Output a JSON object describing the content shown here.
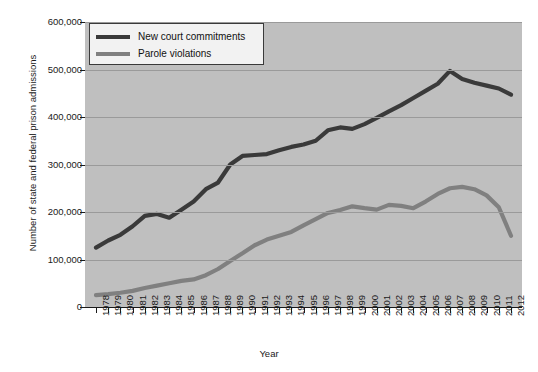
{
  "chart_data": {
    "type": "line",
    "title": "",
    "xlabel": "Year",
    "ylabel": "Number of state and federal prison admissions",
    "xlim": [
      1978,
      2012
    ],
    "ylim": [
      0,
      600000
    ],
    "grid": true,
    "legend_position": "top-left",
    "x": [
      1978,
      1979,
      1980,
      1981,
      1982,
      1983,
      1984,
      1985,
      1986,
      1987,
      1988,
      1989,
      1990,
      1991,
      1992,
      1993,
      1994,
      1995,
      1996,
      1997,
      1998,
      1999,
      2000,
      2001,
      2002,
      2003,
      2004,
      2005,
      2006,
      2007,
      2008,
      2009,
      2010,
      2011,
      2012
    ],
    "ytick_labels": [
      "0",
      "100,000",
      "200,000",
      "300,000",
      "400,000",
      "500,000",
      "600,000"
    ],
    "ytick_values": [
      0,
      100000,
      200000,
      300000,
      400000,
      500000,
      600000
    ],
    "series": [
      {
        "name": "New court commitments",
        "color": "#3a3a3a",
        "values": [
          125000,
          140000,
          152000,
          170000,
          192000,
          196000,
          188000,
          205000,
          222000,
          248000,
          262000,
          300000,
          318000,
          320000,
          322000,
          330000,
          337000,
          342000,
          350000,
          372000,
          378000,
          375000,
          385000,
          398000,
          412000,
          425000,
          440000,
          455000,
          470000,
          497000,
          480000,
          472000,
          466000,
          460000,
          447000
        ]
      },
      {
        "name": "Parole violations",
        "color": "#808080",
        "values": [
          25000,
          27000,
          30000,
          34000,
          40000,
          45000,
          50000,
          55000,
          58000,
          67000,
          80000,
          97000,
          113000,
          130000,
          142000,
          150000,
          158000,
          172000,
          185000,
          198000,
          204000,
          212000,
          208000,
          205000,
          215000,
          213000,
          208000,
          222000,
          238000,
          250000,
          253000,
          248000,
          235000,
          210000,
          150000
        ]
      }
    ]
  },
  "legend": {
    "items": [
      {
        "label": "New court commitments"
      },
      {
        "label": "Parole violations"
      }
    ]
  }
}
